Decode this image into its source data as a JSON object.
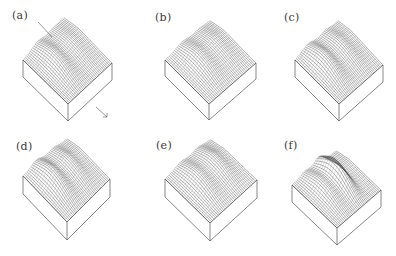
{
  "figure": {
    "panels": [
      {
        "id": "a",
        "label": "(a)",
        "label_pos": [
          12,
          10
        ],
        "top": [
          64,
          22
        ],
        "left": [
          23,
          60
        ],
        "right": [
          112,
          63
        ],
        "bottom": [
          68,
          104
        ],
        "depth": 17,
        "ridges": [
          {
            "u": 0.35,
            "h": 0.9,
            "w": 0.12
          },
          {
            "u": 0.75,
            "h": 0.35,
            "w": 0.1
          }
        ],
        "annotation_line": [
          [
            38,
            22
          ],
          [
            52,
            37
          ]
        ],
        "arrow": [
          [
            96,
            107
          ],
          [
            107,
            117
          ]
        ]
      },
      {
        "id": "b",
        "label": "(b)",
        "label_pos": [
          155,
          12
        ],
        "top": [
          210,
          25
        ],
        "left": [
          165,
          60
        ],
        "right": [
          256,
          63
        ],
        "bottom": [
          209,
          104
        ],
        "depth": 16,
        "ridges": [
          {
            "u": 0.38,
            "h": 0.85,
            "w": 0.13
          },
          {
            "u": 0.75,
            "h": 0.45,
            "w": 0.11
          }
        ]
      },
      {
        "id": "c",
        "label": "(c)",
        "label_pos": [
          284,
          12
        ],
        "top": [
          338,
          25
        ],
        "left": [
          295,
          60
        ],
        "right": [
          383,
          65
        ],
        "bottom": [
          339,
          104
        ],
        "depth": 17,
        "ridges": [
          {
            "u": 0.3,
            "h": 1.1,
            "w": 0.12
          },
          {
            "u": 0.7,
            "h": 0.6,
            "w": 0.1
          }
        ]
      },
      {
        "id": "d",
        "label": "(d)",
        "label_pos": [
          16,
          141
        ],
        "top": [
          67,
          143
        ],
        "left": [
          23,
          176
        ],
        "right": [
          110,
          179
        ],
        "bottom": [
          67,
          222
        ],
        "depth": 18,
        "ridges": [
          {
            "u": 0.3,
            "h": 1.2,
            "w": 0.12
          },
          {
            "u": 0.68,
            "h": 0.7,
            "w": 0.1
          }
        ]
      },
      {
        "id": "e",
        "label": "(e)",
        "label_pos": [
          156,
          140
        ],
        "top": [
          210,
          144
        ],
        "left": [
          165,
          179
        ],
        "right": [
          257,
          180
        ],
        "bottom": [
          210,
          223
        ],
        "depth": 18,
        "ridges": [
          {
            "u": 0.35,
            "h": 0.9,
            "w": 0.12
          },
          {
            "u": 0.72,
            "h": 0.8,
            "w": 0.11
          }
        ]
      },
      {
        "id": "f",
        "label": "(f)",
        "label_pos": [
          284,
          140
        ],
        "top": [
          336,
          155
        ],
        "left": [
          292,
          185
        ],
        "right": [
          381,
          190
        ],
        "bottom": [
          337,
          228
        ],
        "depth": 17,
        "ridges": [
          {
            "u": 0.3,
            "h": 1.0,
            "w": 0.11
          },
          {
            "u": 0.6,
            "h": 1.9,
            "w": 0.09
          }
        ]
      }
    ],
    "colors": {
      "line": "#3c3c3c",
      "box": "#555555",
      "label": "#3a3a3a"
    }
  }
}
